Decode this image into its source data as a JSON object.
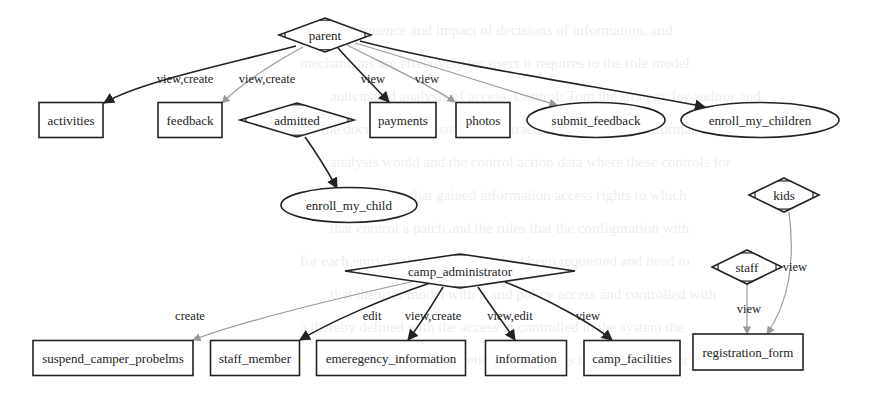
{
  "diagram": {
    "colors": {
      "dark_edge": "#222222",
      "light_edge": "#9a9a9a",
      "node_stroke": "#222222",
      "background": "#ffffff"
    },
    "nodes": [
      {
        "id": "parent",
        "label": "parent",
        "shape": "diamond",
        "cx": 325,
        "cy": 35,
        "w": 92,
        "h": 34
      },
      {
        "id": "activities",
        "label": "activities",
        "shape": "box",
        "cx": 71,
        "cy": 120,
        "w": 64,
        "h": 35
      },
      {
        "id": "feedback",
        "label": "feedback",
        "shape": "box",
        "cx": 190,
        "cy": 120,
        "w": 64,
        "h": 35
      },
      {
        "id": "admitted",
        "label": "admitted",
        "shape": "diamond",
        "cx": 297,
        "cy": 120,
        "w": 114,
        "h": 34
      },
      {
        "id": "payments",
        "label": "payments",
        "shape": "box",
        "cx": 403,
        "cy": 120,
        "w": 66,
        "h": 35
      },
      {
        "id": "photos",
        "label": "photos",
        "shape": "box",
        "cx": 483,
        "cy": 120,
        "w": 54,
        "h": 35
      },
      {
        "id": "submit_feedback",
        "label": "submit_feedback",
        "shape": "ellipse",
        "cx": 596,
        "cy": 120,
        "w": 138,
        "h": 35
      },
      {
        "id": "enroll_my_children",
        "label": "enroll_my_children",
        "shape": "ellipse",
        "cx": 760,
        "cy": 120,
        "w": 158,
        "h": 35
      },
      {
        "id": "enroll_my_child",
        "label": "enroll_my_child",
        "shape": "ellipse",
        "cx": 349,
        "cy": 205,
        "w": 136,
        "h": 35
      },
      {
        "id": "kids",
        "label": "kids",
        "shape": "diamond",
        "cx": 784,
        "cy": 195,
        "w": 70,
        "h": 34
      },
      {
        "id": "staff",
        "label": "staff",
        "shape": "diamond",
        "cx": 747,
        "cy": 267,
        "w": 70,
        "h": 34
      },
      {
        "id": "camp_administrator",
        "label": "camp_administrator",
        "shape": "diamond",
        "cx": 460,
        "cy": 271,
        "w": 230,
        "h": 34
      },
      {
        "id": "suspend_camper_probelms",
        "label": "suspend_camper_probelms",
        "shape": "box",
        "cx": 113,
        "cy": 358,
        "w": 160,
        "h": 35
      },
      {
        "id": "staff_member",
        "label": "staff_member",
        "shape": "box",
        "cx": 255,
        "cy": 358,
        "w": 89,
        "h": 35
      },
      {
        "id": "emeregency_information",
        "label": "emeregency_information",
        "shape": "box",
        "cx": 391,
        "cy": 358,
        "w": 149,
        "h": 35
      },
      {
        "id": "information",
        "label": "information",
        "shape": "box",
        "cx": 526,
        "cy": 358,
        "w": 81,
        "h": 35
      },
      {
        "id": "camp_facilities",
        "label": "camp_facilities",
        "shape": "box",
        "cx": 632,
        "cy": 358,
        "w": 96,
        "h": 35
      },
      {
        "id": "registration_form",
        "label": "registration_form",
        "shape": "box",
        "cx": 748,
        "cy": 352,
        "w": 110,
        "h": 36
      }
    ],
    "edges": [
      {
        "from": "parent",
        "to": "activities",
        "label": "view,create",
        "style": "dark",
        "path": "M296,46 C220,66 140,82 104,103",
        "lx": 185,
        "ly": 83
      },
      {
        "from": "parent",
        "to": "feedback",
        "label": "view,create",
        "style": "light",
        "path": "M303,47 C270,65 240,85 222,103",
        "lx": 267,
        "ly": 83
      },
      {
        "from": "parent",
        "to": "payments",
        "label": "view",
        "style": "dark",
        "path": "M338,48 C352,64 375,87 389,102",
        "lx": 373,
        "ly": 83
      },
      {
        "from": "parent",
        "to": "photos",
        "label": "view",
        "style": "light",
        "path": "M347,45 C380,62 430,85 455,102",
        "lx": 427,
        "ly": 83
      },
      {
        "from": "parent",
        "to": "submit_feedback",
        "label": "",
        "style": "light",
        "path": "M355,43 C420,62 500,88 557,105",
        "lx": 0,
        "ly": 0
      },
      {
        "from": "parent",
        "to": "enroll_my_children",
        "label": "",
        "style": "dark",
        "path": "M360,41 C450,65 620,90 705,107",
        "lx": 0,
        "ly": 0
      },
      {
        "from": "admitted",
        "to": "enroll_my_child",
        "label": "",
        "style": "dark",
        "path": "M305,137 C318,155 328,172 337,188",
        "lx": 0,
        "ly": 0
      },
      {
        "from": "camp_administrator",
        "to": "suspend_camper_probelms",
        "label": "create",
        "style": "light",
        "path": "M415,281 C330,300 240,322 193,340",
        "lx": 190,
        "ly": 320
      },
      {
        "from": "camp_administrator",
        "to": "staff_member",
        "label": "edit",
        "style": "dark",
        "path": "M430,283 C380,300 330,322 300,340",
        "lx": 372,
        "ly": 320
      },
      {
        "from": "camp_administrator",
        "to": "emeregency_information",
        "label": "view,create",
        "style": "dark",
        "path": "M443,287 C432,305 420,325 408,340",
        "lx": 433,
        "ly": 320
      },
      {
        "from": "camp_administrator",
        "to": "information",
        "label": "view,edit",
        "style": "dark",
        "path": "M478,287 C490,305 505,325 515,340",
        "lx": 510,
        "ly": 320
      },
      {
        "from": "camp_administrator",
        "to": "camp_facilities",
        "label": "view",
        "style": "dark",
        "path": "M505,282 C545,298 590,322 612,340",
        "lx": 588,
        "ly": 320
      },
      {
        "from": "staff",
        "to": "registration_form",
        "label": "view",
        "style": "light",
        "path": "M747,284 C747,300 747,318 747,334",
        "lx": 749,
        "ly": 313
      },
      {
        "from": "kids",
        "to": "registration_form",
        "label": "view",
        "style": "light",
        "path": "M789,212 C795,260 790,300 767,334",
        "lx": 795,
        "ly": 271
      }
    ]
  },
  "background_text": [
    "consequence and impact of decisions of information, and",
    "mechanisms are effectively for users it requires to the role model",
    "anticipated analysis of access. Control: Tom the strategy for auditor and",
    "for the document analysis of the extracted access control information",
    "analysis would and the control action data where these controls for",
    "an user to capture that gained information access rights to which",
    "that control a patch and the rules that the configuration with",
    "for each entry in the records they had been requested and need to",
    "that the user model with it and policy access and controlled with",
    "a thereby defined with the access in controlled in the system the",
    "to guarantee the completion the model is the user results for"
  ]
}
